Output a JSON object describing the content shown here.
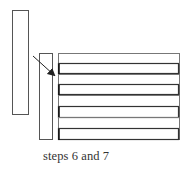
{
  "caption": "steps 6 and 7",
  "colors": {
    "stroke": "#555555",
    "stroke_dark": "#333333",
    "background": "#ffffff"
  },
  "shapes": {
    "tall_rect": {
      "x": 12.5,
      "y": 10.5,
      "w": 16,
      "h": 104
    },
    "middle_rect": {
      "x": 39.5,
      "y": 53.5,
      "w": 13,
      "h": 86
    },
    "stack_rect": {
      "x": 58.5,
      "y": 53.5,
      "w": 121,
      "h": 86
    },
    "strip_count": 8,
    "arrow": {
      "x1": 33,
      "y1": 56,
      "x2": 56,
      "y2": 77
    }
  }
}
